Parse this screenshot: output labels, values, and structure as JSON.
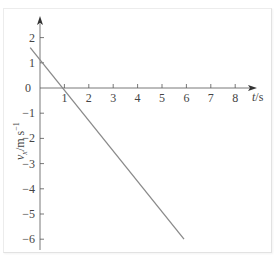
{
  "chart_data": {
    "type": "line",
    "title": "",
    "xlabel": "t/s",
    "ylabel": "v_x/m s^-1",
    "xlim": [
      -0.4,
      8.8
    ],
    "ylim": [
      -6.4,
      2.6
    ],
    "x_ticks": [
      0,
      1,
      2,
      3,
      4,
      5,
      6,
      7,
      8
    ],
    "x_tick_labels": [
      "1",
      "2",
      "3",
      "4",
      "5",
      "6",
      "7",
      "8"
    ],
    "y_ticks": [
      2,
      1,
      0,
      -1,
      -2,
      -3,
      -4,
      -5,
      -6
    ],
    "y_tick_labels": [
      "2",
      "1",
      "0",
      "−1",
      "−2",
      "−3",
      "−4",
      "−5",
      "−6"
    ],
    "grid": false,
    "legend": null,
    "series": [
      {
        "name": "v_x(t)",
        "color": "#8a8a8a",
        "x": [
          -0.4,
          5.9
        ],
        "y": [
          1.6,
          -6.0
        ],
        "equation": "v_x = 1.1 - 1.2 t"
      }
    ]
  },
  "axes": {
    "origin_label": "0",
    "x_axis_title_t": "t",
    "x_axis_title_unit": "/s",
    "y_axis_title_v": "v",
    "y_axis_title_sub": "x",
    "y_axis_title_unit": "/m s",
    "y_axis_title_exp": "−1"
  },
  "colors": {
    "axis": "#555555",
    "line": "#8a8a8a",
    "text": "#444444"
  }
}
